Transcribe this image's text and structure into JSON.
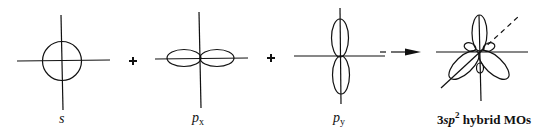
{
  "diagram": {
    "orbitals": [
      {
        "id": "s",
        "label": "s"
      },
      {
        "id": "px",
        "label_main": "p",
        "label_sub": "x"
      },
      {
        "id": "py",
        "label_main": "p",
        "label_sub": "y"
      },
      {
        "id": "hybrid",
        "label_prefix": "3",
        "label_italic": "sp",
        "label_sup": "2",
        "label_suffix": " hybrid MOs"
      }
    ],
    "operators": [
      "+",
      "+"
    ],
    "arrow": "→",
    "colors": {
      "stroke": "#111111",
      "background": "#ffffff"
    }
  }
}
